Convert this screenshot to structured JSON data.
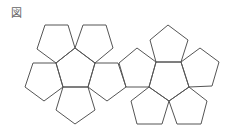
{
  "figure": {
    "label": "図",
    "stroke_color": "#555555",
    "face_count": 12
  }
}
